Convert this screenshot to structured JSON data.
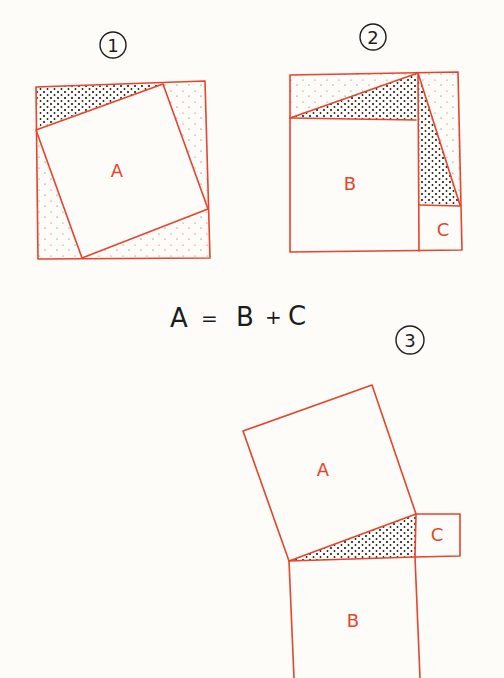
{
  "diagram": {
    "panels": [
      {
        "number": "1",
        "inner_square_label": "A"
      },
      {
        "number": "2",
        "square_labels": [
          "B",
          "C"
        ]
      },
      {
        "number": "3",
        "square_labels": [
          "A",
          "B",
          "C"
        ]
      }
    ],
    "equation": {
      "lhs": "A",
      "eq": "=",
      "rhs_1": "B",
      "plus": "+",
      "rhs_2": "C"
    },
    "colors": {
      "line": "#e8432c",
      "ink": "#1c1c1c",
      "paper": "#fdfcf8"
    }
  }
}
